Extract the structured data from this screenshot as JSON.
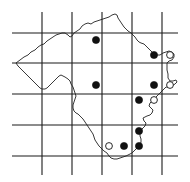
{
  "map": {
    "type": "grid distribution map",
    "colors": {
      "background": "#ffffff",
      "grid": "#1a1a1a",
      "outline": "#222222",
      "marker": "#111111"
    },
    "grid": {
      "vertical_x": [
        42,
        72,
        102,
        132,
        162
      ],
      "horizontal_y": [
        33,
        63,
        94,
        125,
        156
      ],
      "x_extent": [
        12,
        178
      ],
      "y_extent": [
        12,
        175
      ]
    },
    "legend_symbols": {
      "filled_circle": "record (filled circle)",
      "open_circle": "record (open circle)"
    },
    "records_filled": [
      {
        "x": 96,
        "y": 40
      },
      {
        "x": 154,
        "y": 55
      },
      {
        "x": 96,
        "y": 85
      },
      {
        "x": 154,
        "y": 85
      },
      {
        "x": 139,
        "y": 100
      },
      {
        "x": 139,
        "y": 131
      },
      {
        "x": 124,
        "y": 146
      },
      {
        "x": 139,
        "y": 146
      }
    ],
    "records_open": [
      {
        "x": 170,
        "y": 55
      },
      {
        "x": 170,
        "y": 85
      },
      {
        "x": 154,
        "y": 100
      },
      {
        "x": 109,
        "y": 146
      }
    ],
    "counts": {
      "filled": 8,
      "open": 4
    }
  }
}
